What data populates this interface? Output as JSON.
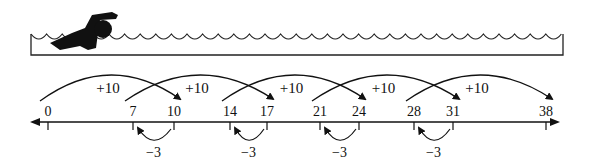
{
  "scene": {
    "description": "Swimmer in a pool above a number line showing +10 and -3 jumps"
  },
  "number_line": {
    "labels": [
      "0",
      "7",
      "10",
      "14",
      "17",
      "21",
      "24",
      "28",
      "31",
      "38"
    ],
    "positions": [
      48,
      133,
      174,
      230,
      267,
      320,
      359,
      414,
      453,
      546
    ]
  },
  "jumps_forward": [
    {
      "label": "+10",
      "from": "0",
      "to": "10"
    },
    {
      "label": "+10",
      "from": "7",
      "to": "17"
    },
    {
      "label": "+10",
      "from": "14",
      "to": "24"
    },
    {
      "label": "+10",
      "from": "21",
      "to": "31"
    },
    {
      "label": "+10",
      "from": "28",
      "to": "38"
    }
  ],
  "jumps_back": [
    {
      "label": "−3",
      "from": "10",
      "to": "7"
    },
    {
      "label": "−3",
      "from": "17",
      "to": "14"
    },
    {
      "label": "−3",
      "from": "24",
      "to": "21"
    },
    {
      "label": "−3",
      "from": "31",
      "to": "28"
    }
  ]
}
